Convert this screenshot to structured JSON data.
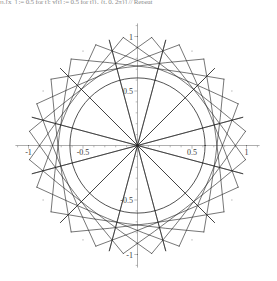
{
  "window": {
    "title": "Parametric envelope plot"
  },
  "code_line": {
    "text": "η₁[x_] := 0.5 for t]; y[t] := 0.5 for t]}, {t, 0, 2π}] // Repeat"
  },
  "plot": {
    "title": "",
    "background_color": "#ffffff",
    "curve_color": "#222222",
    "axis_color": "#8c8c8c",
    "axis": {
      "x_label": "",
      "y_label": "",
      "x_ticks": [
        "-1",
        "-0.5",
        "0.5",
        "1"
      ],
      "y_ticks": [
        "-1",
        "-0.5",
        "0.5",
        "1"
      ],
      "x_tick_values": [
        -1,
        -0.5,
        0.5,
        1
      ],
      "y_tick_values": [
        -1,
        -0.5,
        0.5,
        1
      ],
      "xlim": [
        -1.12,
        1.12
      ],
      "ylim": [
        -1.12,
        1.12
      ],
      "minor_ticks": true,
      "grid": false
    }
  },
  "chart_data": {
    "type": "line",
    "title": "",
    "xlabel": "",
    "ylabel": "",
    "xlim": [
      -1.12,
      1.12
    ],
    "ylim": [
      -1.12,
      1.12
    ],
    "grid": false,
    "legend": null,
    "parameters": {
      "n_points": 48,
      "step_multiplier": 13,
      "n_spikes": 24,
      "inner_envelope_radius": 0.62,
      "outer_radius": 1.0,
      "chord_count": 48,
      "arc_bulge": 0.16
    },
    "x_ticks": [
      -1,
      -0.5,
      0.5,
      1
    ],
    "y_ticks": [
      -1,
      -0.5,
      0.5,
      1
    ],
    "x_tick_labels": [
      "-1",
      "-0.5",
      "0.5",
      "1"
    ],
    "y_tick_labels": [
      "-1",
      "-0.5",
      "0.5",
      "1"
    ]
  }
}
